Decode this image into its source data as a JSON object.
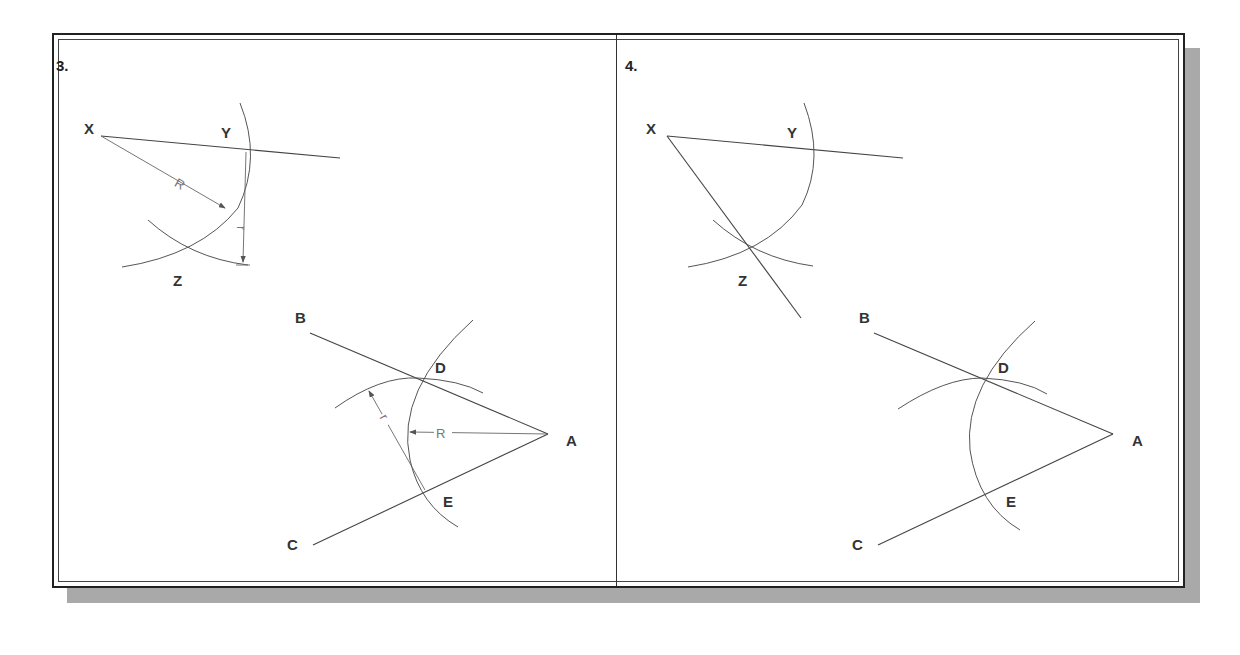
{
  "figure": {
    "panels": [
      {
        "number": "3.",
        "points": {
          "X": "X",
          "Y": "Y",
          "Z": "Z",
          "A": "A",
          "B": "B",
          "C": "C",
          "D": "D",
          "E": "E"
        },
        "dimensions": {
          "radius_large": "R",
          "radius_small": "r"
        }
      },
      {
        "number": "4.",
        "points": {
          "X": "X",
          "Y": "Y",
          "Z": "Z",
          "A": "A",
          "B": "B",
          "C": "C",
          "D": "D",
          "E": "E"
        }
      }
    ],
    "colors": {
      "frame": "#222222",
      "shadow": "#a9a9a9",
      "lines": "#444444",
      "background": "#ffffff"
    }
  }
}
